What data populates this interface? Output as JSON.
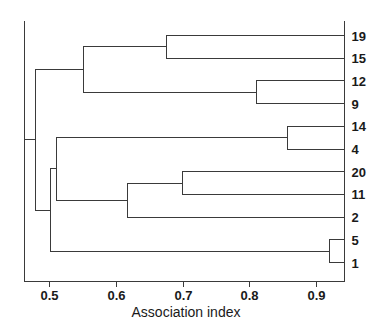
{
  "chart_data": {
    "type": "dendrogram",
    "title": "",
    "xlabel": "Association index",
    "ylabel": "",
    "xlim": [
      0.4475,
      0.9475
    ],
    "xticks": [
      0.5,
      0.6,
      0.7,
      0.8,
      0.9
    ],
    "xtick_labels": [
      "0.5",
      "0.6",
      "0.7",
      "0.8",
      "0.9"
    ],
    "grid": false,
    "legend": null,
    "orientation": "horizontal-right-leaves",
    "leaf_order": [
      "19",
      "15",
      "12",
      "9",
      "14",
      "4",
      "20",
      "11",
      "2",
      "5",
      "1"
    ],
    "leaves": [
      {
        "label": "19",
        "position": 0
      },
      {
        "label": "15",
        "position": 1
      },
      {
        "label": "12",
        "position": 2
      },
      {
        "label": "9",
        "position": 3
      },
      {
        "label": "14",
        "position": 4
      },
      {
        "label": "4",
        "position": 5
      },
      {
        "label": "20",
        "position": 6
      },
      {
        "label": "11",
        "position": 7
      },
      {
        "label": "2",
        "position": 8
      },
      {
        "label": "5",
        "position": 9
      },
      {
        "label": "1",
        "position": 10
      }
    ],
    "merges": [
      {
        "id": "n1",
        "children": [
          "19",
          "15"
        ],
        "height": 0.668
      },
      {
        "id": "n2",
        "children": [
          "12",
          "9"
        ],
        "height": 0.809
      },
      {
        "id": "n3",
        "children": [
          "n1",
          "n2"
        ],
        "height": 0.539
      },
      {
        "id": "n4",
        "children": [
          "14",
          "4"
        ],
        "height": 0.857
      },
      {
        "id": "n5",
        "children": [
          "20",
          "11"
        ],
        "height": 0.694
      },
      {
        "id": "n6",
        "children": [
          "n5",
          "2"
        ],
        "height": 0.608
      },
      {
        "id": "n7",
        "children": [
          "n4",
          "n6"
        ],
        "height": 0.497
      },
      {
        "id": "n8",
        "children": [
          "5",
          "1"
        ],
        "height": 0.924
      },
      {
        "id": "n9",
        "children": [
          "n7",
          "n8"
        ],
        "height": 0.487
      },
      {
        "id": "n10",
        "children": [
          "n3",
          "n9"
        ],
        "height": 0.464
      }
    ],
    "axis_title": "Association index"
  },
  "axis": {
    "title": "Association index",
    "tick_labels": [
      "0.5",
      "0.6",
      "0.7",
      "0.8",
      "0.9"
    ]
  },
  "leaf_labels": [
    "19",
    "15",
    "12",
    "9",
    "14",
    "4",
    "20",
    "11",
    "2",
    "5",
    "1"
  ],
  "colors": {
    "line": "#3a3a3a",
    "text": "#1a1a1a",
    "background": "#ffffff"
  }
}
